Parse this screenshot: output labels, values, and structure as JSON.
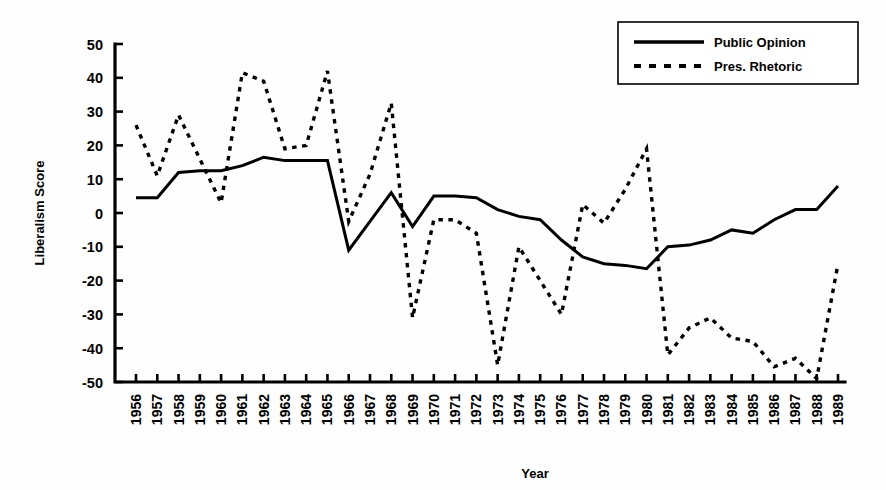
{
  "chart_data": {
    "type": "line",
    "title": "",
    "xlabel": "Year",
    "ylabel": "Liberalism Score",
    "xlim": [
      1956,
      1989
    ],
    "ylim": [
      -50,
      50
    ],
    "ytick_step": 10,
    "grid": false,
    "legend_position": "top-right",
    "x": [
      1956,
      1957,
      1958,
      1959,
      1960,
      1961,
      1962,
      1963,
      1964,
      1965,
      1966,
      1967,
      1968,
      1969,
      1970,
      1971,
      1972,
      1973,
      1974,
      1975,
      1976,
      1977,
      1978,
      1979,
      1980,
      1981,
      1982,
      1983,
      1984,
      1985,
      1986,
      1987,
      1988,
      1989
    ],
    "yticks": [
      50,
      40,
      30,
      20,
      10,
      0,
      -10,
      -20,
      -30,
      -40,
      -50
    ],
    "ytick_labels": [
      "50",
      "40",
      "30",
      "20",
      "10",
      "0",
      "-10",
      "-20",
      "-30",
      "-40",
      "-50"
    ],
    "xtick_labels": [
      "1956",
      "1957",
      "1958",
      "1959",
      "1960",
      "1961",
      "1962",
      "1963",
      "1964",
      "1965",
      "1966",
      "1967",
      "1968",
      "1969",
      "1970",
      "1971",
      "1972",
      "1973",
      "1974",
      "1975",
      "1976",
      "1977",
      "1978",
      "1979",
      "1980",
      "1981",
      "1982",
      "1983",
      "1984",
      "1985",
      "1986",
      "1987",
      "1988",
      "1989"
    ],
    "series": [
      {
        "name": "Public Opinion",
        "style": "solid",
        "color": "#000000",
        "values": [
          4.5,
          4.5,
          12,
          12.5,
          12.5,
          14,
          16.5,
          15.5,
          15.5,
          15.5,
          -11,
          -2.5,
          6,
          -4,
          5,
          5,
          4.5,
          1,
          -1,
          -2,
          -8,
          -13,
          -15,
          -15.5,
          -16.5,
          -10,
          -9.5,
          -8,
          -5,
          -6,
          -2,
          1,
          1,
          8
        ]
      },
      {
        "name": "Pres. Rhetoric",
        "style": "dashed",
        "color": "#000000",
        "values": [
          26,
          11,
          29,
          16,
          3,
          41.5,
          39,
          19,
          20,
          42,
          -2.5,
          11.5,
          32.5,
          -31,
          -2,
          -2,
          -6,
          -45,
          -10,
          -20,
          -30,
          2.5,
          -3,
          7,
          19,
          -42,
          -34,
          -31,
          -37,
          -38,
          -45.5,
          -43,
          -49,
          -15
        ]
      }
    ]
  },
  "legend": {
    "items": [
      {
        "label": "Public Opinion",
        "style": "solid"
      },
      {
        "label": "Pres. Rhetoric",
        "style": "dashed"
      }
    ]
  }
}
